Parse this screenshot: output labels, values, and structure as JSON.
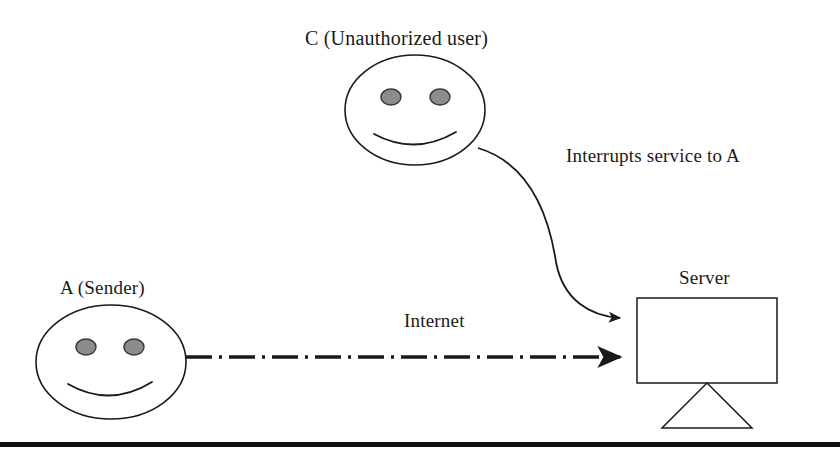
{
  "diagram": {
    "background_color": "#ffffff",
    "stroke_color": "#1a1a1a",
    "eye_fill_color": "#8c8c8c",
    "rule_color": "#111111",
    "nodes": [
      {
        "id": "attacker",
        "type": "smiley-face",
        "label": "C (Unauthorized user)",
        "cx": 415,
        "cy": 110,
        "rx": 70,
        "ry": 55
      },
      {
        "id": "sender",
        "type": "smiley-face",
        "label": "A (Sender)",
        "cx": 111,
        "cy": 362,
        "rx": 75,
        "ry": 57
      },
      {
        "id": "server",
        "type": "monitor",
        "label": "Server",
        "x": 637,
        "y": 298,
        "width": 140,
        "height": 85
      }
    ],
    "connections": [
      {
        "id": "attack-link",
        "label": "Interrupts service to A",
        "style": "curved-solid",
        "from": "attacker",
        "to": "server",
        "arrowhead": "filled-triangle"
      },
      {
        "id": "internet-link",
        "label": "Internet",
        "style": "dash-dot",
        "from": "sender",
        "to": "server",
        "arrowhead": "filled-triangle"
      }
    ]
  }
}
